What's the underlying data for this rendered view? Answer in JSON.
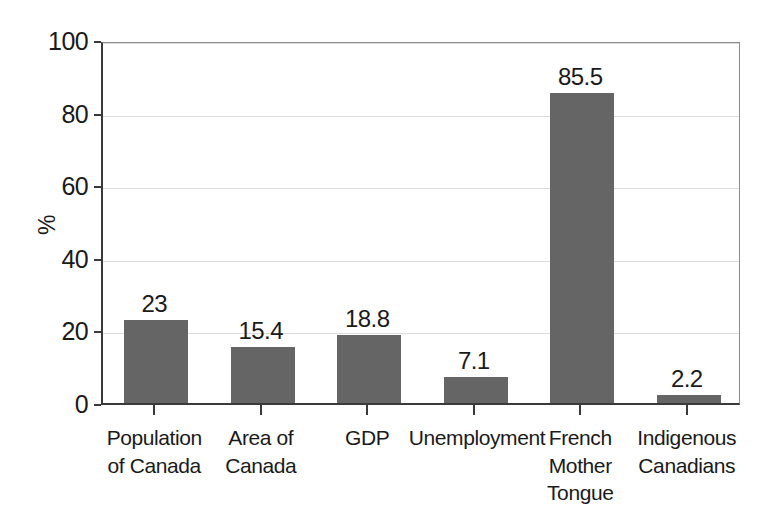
{
  "chart_data": {
    "type": "bar",
    "title": "",
    "subtitle": "",
    "xlabel": "",
    "ylabel": "%",
    "ylim": [
      0,
      100
    ],
    "ytick_labels": [
      "0",
      "20",
      "40",
      "60",
      "80",
      "100"
    ],
    "ytick_values": [
      0,
      20,
      40,
      60,
      80,
      100
    ],
    "grid": true,
    "legend": false,
    "legend_position": "none",
    "bar_color": "#656565",
    "categories": [
      "Population of Canada",
      "Area of Canada",
      "GDP",
      "Unemployment",
      "French Mother Tongue",
      "Indigenous Canadians"
    ],
    "category_lines": [
      [
        "Population",
        "of Canada"
      ],
      [
        "Area of",
        "Canada"
      ],
      [
        "GDP"
      ],
      [
        "Unemployment"
      ],
      [
        "French",
        "Mother",
        "Tongue"
      ],
      [
        "Indigenous",
        "Canadians"
      ]
    ],
    "values": [
      23,
      15.4,
      18.8,
      7.1,
      85.5,
      2.2
    ],
    "value_labels": [
      "23",
      "15.4",
      "18.8",
      "7.1",
      "85.5",
      "2.2"
    ]
  }
}
